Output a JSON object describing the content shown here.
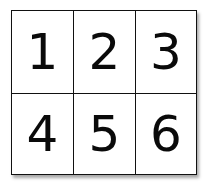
{
  "grid": {
    "rows": 2,
    "columns": 3,
    "cells": [
      "1",
      "2",
      "3",
      "4",
      "5",
      "6"
    ]
  }
}
